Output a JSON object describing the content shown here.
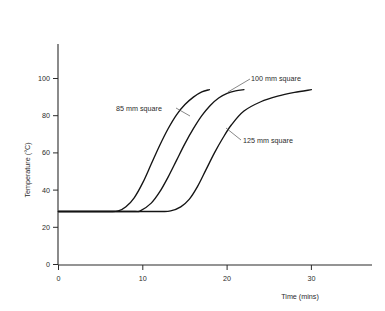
{
  "chart_data": {
    "type": "line",
    "title": "",
    "subtitle": "",
    "xlabel": "Time (mins)",
    "ylabel": "Temperature (°C)",
    "xlim": [
      0,
      37
    ],
    "ylim": [
      0,
      118
    ],
    "xticks": [
      0,
      10,
      20,
      30
    ],
    "xticklabels": [
      "0",
      "10",
      "20",
      "30"
    ],
    "yticks": [
      0,
      20,
      40,
      60,
      80,
      100
    ],
    "yticklabels": [
      "0",
      "20",
      "40",
      "60",
      "80",
      "100"
    ],
    "grid": false,
    "legend": "inline-annotations",
    "series": [
      {
        "name": "85 mm square",
        "label": "85 mm square",
        "x": [
          0,
          2,
          4,
          6,
          7.1,
          8,
          9,
          10,
          11,
          12,
          13,
          14,
          15,
          16,
          17,
          17.9
        ],
        "y": [
          28.5,
          28.5,
          28.5,
          28.5,
          28.8,
          31,
          36,
          44,
          54,
          64,
          73,
          80.5,
          86,
          90,
          92.8,
          94
        ]
      },
      {
        "name": "100 mm square",
        "label": "100 mm square",
        "x": [
          0,
          3,
          6,
          9,
          9.7,
          11,
          12,
          13,
          14,
          15,
          16,
          17,
          18,
          19,
          20,
          21,
          22
        ],
        "y": [
          28.5,
          28.5,
          28.5,
          28.5,
          28.8,
          33,
          39,
          47,
          56,
          65,
          73,
          80,
          85.5,
          89.5,
          92,
          93.3,
          94
        ]
      },
      {
        "name": "125 mm square",
        "label": "125 mm square",
        "x": [
          0,
          4,
          8,
          12,
          13.3,
          14.5,
          15.5,
          16.5,
          17.5,
          18.5,
          19.5,
          20.5,
          22,
          24,
          26,
          28,
          30
        ],
        "y": [
          28.5,
          28.5,
          28.5,
          28.5,
          28.8,
          31,
          35,
          42,
          51,
          60,
          68,
          75,
          82.5,
          87.5,
          90.5,
          92.5,
          94
        ]
      }
    ],
    "annotations": [
      {
        "text": "85 mm square",
        "x_px": 116,
        "y_px": 111
      },
      {
        "text": "100 mm square",
        "x_px": 251,
        "y_px": 81
      },
      {
        "text": "125 mm square",
        "x_px": 243,
        "y_px": 143
      }
    ]
  }
}
